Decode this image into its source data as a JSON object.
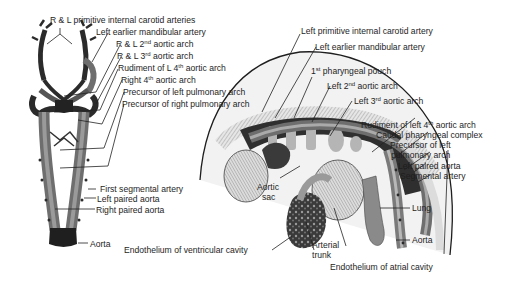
{
  "figure": {
    "left_panel": {
      "description": "Ventral view of aortic arch system",
      "labels": [
        {
          "id": "rl-primitive-internal-carotid",
          "text": "R & L primitive internal carotid arteries"
        },
        {
          "id": "left-earlier-mandibular",
          "text": "Left earlier mandibular artery"
        },
        {
          "id": "rl-2nd-aortic-arch",
          "pre": "R & L 2",
          "sup": "nd",
          "post": " aortic arch"
        },
        {
          "id": "rl-3rd-aortic-arch",
          "pre": "R & L 3",
          "sup": "rd",
          "post": " aortic arch"
        },
        {
          "id": "rudiment-l-4th",
          "pre": "Rudiment of L 4",
          "sup": "th",
          "post": " aortic arch"
        },
        {
          "id": "right-4th",
          "pre": "Right 4",
          "sup": "th",
          "post": " aortic arch"
        },
        {
          "id": "precursor-left-pulmonary",
          "text": "Precursor of left pulmonary arch"
        },
        {
          "id": "precursor-right-pulmonary",
          "text": "Precursor of right pulmonary arch"
        },
        {
          "id": "first-segmental",
          "text": "First segmental artery"
        },
        {
          "id": "left-paired-aorta",
          "text": "Left paired aorta"
        },
        {
          "id": "right-paired-aorta",
          "text": "Right paired aorta"
        },
        {
          "id": "aorta",
          "text": "Aorta"
        }
      ]
    },
    "right_panel": {
      "description": "Lateral view of embryo heart and pharyngeal arches",
      "labels": [
        {
          "id": "left-primitive-internal-carotid",
          "text": "Left primitive internal carotid artery"
        },
        {
          "id": "left-earlier-mandibular",
          "text": "Left earlier mandibular artery"
        },
        {
          "id": "first-pharyngeal-pouch",
          "pre": "1",
          "sup": "st",
          "post": " pharyngeal pouch"
        },
        {
          "id": "left-2nd-aortic-arch",
          "pre": "Left 2",
          "sup": "nd",
          "post": " aortic arch"
        },
        {
          "id": "left-3rd-aortic-arch",
          "pre": "Left 3",
          "sup": "rd",
          "post": " aortic arch"
        },
        {
          "id": "rudiment-left-4th",
          "pre": "Rudiment of left 4",
          "sup": "th",
          "post": " aortic arch"
        },
        {
          "id": "caudal-pharyngeal-complex",
          "text": "Caudal pharyngeal complex"
        },
        {
          "id": "precursor-left-pulmonary-1",
          "text": "Precursor of left"
        },
        {
          "id": "precursor-left-pulmonary-2",
          "text": "pulmonary arch"
        },
        {
          "id": "left-paired-aorta",
          "text": "Left paired aorta"
        },
        {
          "id": "segmental-artery",
          "text": "Segmental artery"
        },
        {
          "id": "aortic-sac-1",
          "text": "Aortic"
        },
        {
          "id": "aortic-sac-2",
          "text": "sac"
        },
        {
          "id": "lung",
          "text": "Lung"
        },
        {
          "id": "aorta",
          "text": "Aorta"
        },
        {
          "id": "endothelium-ventricular",
          "text": "Endothelium of ventricular cavity"
        },
        {
          "id": "arterial-trunk-1",
          "text": "Arterial"
        },
        {
          "id": "arterial-trunk-2",
          "text": "trunk"
        },
        {
          "id": "endothelium-atrial",
          "text": "Endothelium of atrial cavity"
        }
      ]
    },
    "colors": {
      "ink": "#1e1e1e",
      "vessel_dark": "#2b2b2b",
      "vessel_mid": "#6e6e6e",
      "tissue_light": "#d8d8d8",
      "background": "#ffffff"
    }
  }
}
